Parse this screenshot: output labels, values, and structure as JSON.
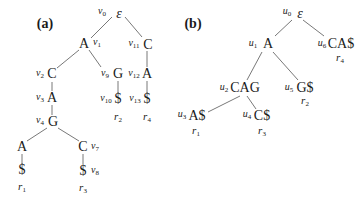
{
  "figure": {
    "panel_a": {
      "label": "(a)",
      "nodes": [
        {
          "id": "v0",
          "base": "v",
          "sub": "0",
          "symbol": "ε"
        },
        {
          "id": "v1",
          "base": "v",
          "sub": "1",
          "symbol": "A"
        },
        {
          "id": "v2",
          "base": "v",
          "sub": "2",
          "symbol": "C"
        },
        {
          "id": "v3",
          "base": "v",
          "sub": "3",
          "symbol": "A"
        },
        {
          "id": "v4",
          "base": "v",
          "sub": "4",
          "symbol": "G"
        },
        {
          "id": "v5",
          "symbol": "A"
        },
        {
          "id": "v6",
          "symbol": "$",
          "read": {
            "base": "r",
            "sub": "1"
          }
        },
        {
          "id": "v7",
          "base": "v",
          "sub": "7",
          "symbol": "C"
        },
        {
          "id": "v8",
          "base": "v",
          "sub": "8",
          "symbol": "$",
          "read": {
            "base": "r",
            "sub": "3"
          }
        },
        {
          "id": "v9",
          "base": "v",
          "sub": "9",
          "symbol": "G"
        },
        {
          "id": "v10",
          "base": "v",
          "sub": "10",
          "symbol": "$",
          "read": {
            "base": "r",
            "sub": "2"
          }
        },
        {
          "id": "v11",
          "base": "v",
          "sub": "11",
          "symbol": "C"
        },
        {
          "id": "v12",
          "base": "v",
          "sub": "12",
          "symbol": "A"
        },
        {
          "id": "v13",
          "base": "v",
          "sub": "13",
          "symbol": "$",
          "read": {
            "base": "r",
            "sub": "4"
          }
        }
      ],
      "edges": [
        [
          "v0",
          "v1"
        ],
        [
          "v0",
          "v11"
        ],
        [
          "v1",
          "v2"
        ],
        [
          "v1",
          "v9"
        ],
        [
          "v2",
          "v3"
        ],
        [
          "v3",
          "v4"
        ],
        [
          "v4",
          "v5"
        ],
        [
          "v4",
          "v7"
        ],
        [
          "v5",
          "v6"
        ],
        [
          "v7",
          "v8"
        ],
        [
          "v9",
          "v10"
        ],
        [
          "v11",
          "v12"
        ],
        [
          "v12",
          "v13"
        ]
      ]
    },
    "panel_b": {
      "label": "(b)",
      "nodes": [
        {
          "id": "u0",
          "base": "u",
          "sub": "0",
          "symbol": "ε"
        },
        {
          "id": "u1",
          "base": "u",
          "sub": "1",
          "symbol": "A"
        },
        {
          "id": "u2",
          "base": "u",
          "sub": "2",
          "symbol": "CAG"
        },
        {
          "id": "u3",
          "base": "u",
          "sub": "3",
          "symbol": "A$",
          "read": {
            "base": "r",
            "sub": "1"
          }
        },
        {
          "id": "u4",
          "base": "u",
          "sub": "4",
          "symbol": "C$",
          "read": {
            "base": "r",
            "sub": "3"
          }
        },
        {
          "id": "u5",
          "base": "u",
          "sub": "5",
          "symbol": "G$",
          "read": {
            "base": "r",
            "sub": "2"
          }
        },
        {
          "id": "u6",
          "base": "u",
          "sub": "6",
          "symbol": "CA$",
          "read": {
            "base": "r",
            "sub": "4"
          }
        }
      ],
      "edges": [
        [
          "u0",
          "u1"
        ],
        [
          "u0",
          "u6"
        ],
        [
          "u1",
          "u2"
        ],
        [
          "u1",
          "u5"
        ],
        [
          "u2",
          "u3"
        ],
        [
          "u2",
          "u4"
        ]
      ]
    }
  }
}
